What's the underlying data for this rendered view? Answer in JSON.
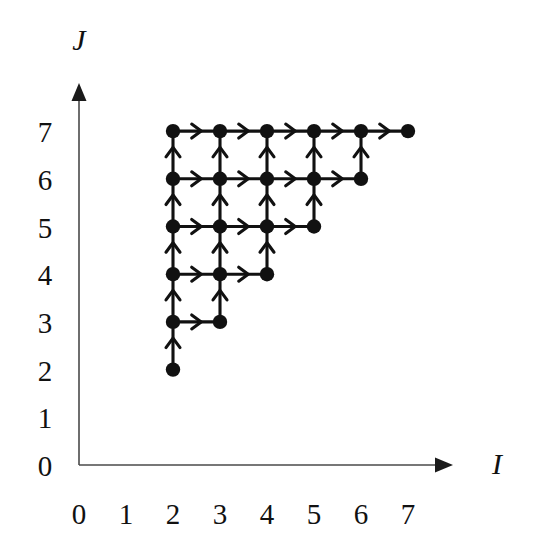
{
  "figure": {
    "background_color": "#ffffff",
    "ink_color": "#111111",
    "axis_color": "#4a4a4a"
  },
  "axes": {
    "x": {
      "name": "I",
      "name_icon": "x-axis-arrow-icon",
      "tick_labels": [
        "0",
        "1",
        "2",
        "3",
        "4",
        "5",
        "6",
        "7"
      ],
      "min": 0,
      "max": 7
    },
    "y": {
      "name": "J",
      "name_icon": "y-axis-arrow-icon",
      "tick_labels": [
        "0",
        "1",
        "2",
        "3",
        "4",
        "5",
        "6",
        "7"
      ],
      "min": 0,
      "max": 7
    }
  },
  "chart_data": {
    "type": "scatter",
    "title": "",
    "subtitle": "",
    "xlabel": "I",
    "ylabel": "J",
    "xlim": [
      0,
      7
    ],
    "ylim": [
      0,
      7
    ],
    "xticks": [
      0,
      1,
      2,
      3,
      4,
      5,
      6,
      7
    ],
    "yticks": [
      0,
      1,
      2,
      3,
      4,
      5,
      6,
      7
    ],
    "grid": false,
    "legend": null,
    "annotations": [],
    "nodes": [
      {
        "i": 2,
        "j": 2
      },
      {
        "i": 2,
        "j": 3
      },
      {
        "i": 3,
        "j": 3
      },
      {
        "i": 2,
        "j": 4
      },
      {
        "i": 3,
        "j": 4
      },
      {
        "i": 4,
        "j": 4
      },
      {
        "i": 2,
        "j": 5
      },
      {
        "i": 3,
        "j": 5
      },
      {
        "i": 4,
        "j": 5
      },
      {
        "i": 5,
        "j": 5
      },
      {
        "i": 2,
        "j": 6
      },
      {
        "i": 3,
        "j": 6
      },
      {
        "i": 4,
        "j": 6
      },
      {
        "i": 5,
        "j": 6
      },
      {
        "i": 6,
        "j": 6
      },
      {
        "i": 2,
        "j": 7
      },
      {
        "i": 3,
        "j": 7
      },
      {
        "i": 4,
        "j": 7
      },
      {
        "i": 5,
        "j": 7
      },
      {
        "i": 6,
        "j": 7
      },
      {
        "i": 7,
        "j": 7
      }
    ],
    "edges_right": [
      {
        "from": [
          2,
          3
        ],
        "to": [
          3,
          3
        ]
      },
      {
        "from": [
          2,
          4
        ],
        "to": [
          3,
          4
        ]
      },
      {
        "from": [
          3,
          4
        ],
        "to": [
          4,
          4
        ]
      },
      {
        "from": [
          2,
          5
        ],
        "to": [
          3,
          5
        ]
      },
      {
        "from": [
          3,
          5
        ],
        "to": [
          4,
          5
        ]
      },
      {
        "from": [
          4,
          5
        ],
        "to": [
          5,
          5
        ]
      },
      {
        "from": [
          2,
          6
        ],
        "to": [
          3,
          6
        ]
      },
      {
        "from": [
          3,
          6
        ],
        "to": [
          4,
          6
        ]
      },
      {
        "from": [
          4,
          6
        ],
        "to": [
          5,
          6
        ]
      },
      {
        "from": [
          5,
          6
        ],
        "to": [
          6,
          6
        ]
      },
      {
        "from": [
          2,
          7
        ],
        "to": [
          3,
          7
        ]
      },
      {
        "from": [
          3,
          7
        ],
        "to": [
          4,
          7
        ]
      },
      {
        "from": [
          4,
          7
        ],
        "to": [
          5,
          7
        ]
      },
      {
        "from": [
          5,
          7
        ],
        "to": [
          6,
          7
        ]
      },
      {
        "from": [
          6,
          7
        ],
        "to": [
          7,
          7
        ]
      }
    ],
    "edges_up": [
      {
        "from": [
          2,
          2
        ],
        "to": [
          2,
          3
        ]
      },
      {
        "from": [
          2,
          3
        ],
        "to": [
          2,
          4
        ]
      },
      {
        "from": [
          3,
          3
        ],
        "to": [
          3,
          4
        ]
      },
      {
        "from": [
          2,
          4
        ],
        "to": [
          2,
          5
        ]
      },
      {
        "from": [
          3,
          4
        ],
        "to": [
          3,
          5
        ]
      },
      {
        "from": [
          4,
          4
        ],
        "to": [
          4,
          5
        ]
      },
      {
        "from": [
          2,
          5
        ],
        "to": [
          2,
          6
        ]
      },
      {
        "from": [
          3,
          5
        ],
        "to": [
          3,
          6
        ]
      },
      {
        "from": [
          4,
          5
        ],
        "to": [
          4,
          6
        ]
      },
      {
        "from": [
          5,
          5
        ],
        "to": [
          5,
          6
        ]
      },
      {
        "from": [
          2,
          6
        ],
        "to": [
          2,
          7
        ]
      },
      {
        "from": [
          3,
          6
        ],
        "to": [
          3,
          7
        ]
      },
      {
        "from": [
          4,
          6
        ],
        "to": [
          4,
          7
        ]
      },
      {
        "from": [
          5,
          6
        ],
        "to": [
          5,
          7
        ]
      },
      {
        "from": [
          6,
          6
        ],
        "to": [
          6,
          7
        ]
      }
    ]
  }
}
